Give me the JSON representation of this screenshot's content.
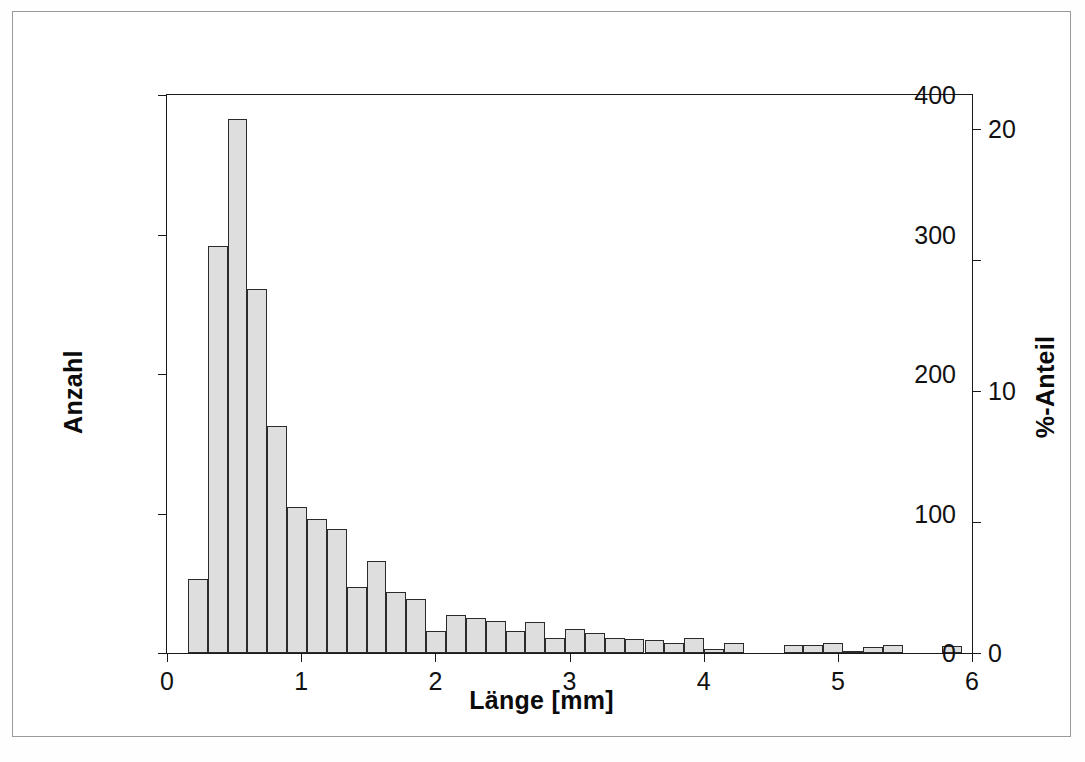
{
  "figure": {
    "background_color": "#ffffff",
    "frame_color": "#9a9a9a",
    "bar_fill_color": "#dedede",
    "bar_edge_color": "#2b2b2b",
    "axis_color": "#1a1a1a"
  },
  "axes": {
    "x_title": "Länge [mm]",
    "y_left_title": "Anzahl",
    "y_right_title": "%-Anteil",
    "x_ticks": [
      {
        "value": 0,
        "label": "0"
      },
      {
        "value": 1,
        "label": "1"
      },
      {
        "value": 2,
        "label": "2"
      },
      {
        "value": 3,
        "label": "3"
      },
      {
        "value": 4,
        "label": "4"
      },
      {
        "value": 5,
        "label": "5"
      },
      {
        "value": 6,
        "label": "6"
      }
    ],
    "y_left_ticks": [
      {
        "value": 0,
        "label": "0"
      },
      {
        "value": 100,
        "label": "100"
      },
      {
        "value": 200,
        "label": "200"
      },
      {
        "value": 300,
        "label": "300"
      },
      {
        "value": 400,
        "label": "400"
      }
    ],
    "y_right_ticks": [
      {
        "value": 0,
        "label": "0"
      },
      {
        "value": 5,
        "label": ""
      },
      {
        "value": 10,
        "label": "10"
      },
      {
        "value": 15,
        "label": ""
      },
      {
        "value": 20,
        "label": "20"
      }
    ]
  },
  "chart_data": {
    "type": "bar",
    "title": "",
    "subtitle": "",
    "xlabel": "Länge [mm]",
    "ylabel": "Anzahl",
    "y2label": "%-Anteil",
    "xlim": [
      0,
      6
    ],
    "ylim": [
      0,
      400
    ],
    "y2lim": [
      0,
      21.3
    ],
    "grid": false,
    "legend": null,
    "bin_width": 0.148,
    "bin_start": 0.155,
    "x_tick_labels": [
      "0",
      "1",
      "2",
      "3",
      "4",
      "5",
      "6"
    ],
    "y_tick_labels": [
      "0",
      "100",
      "200",
      "300",
      "400"
    ],
    "y2_tick_labels": [
      "0",
      "",
      "10",
      "",
      "20"
    ],
    "bins": [
      {
        "x0": 0.155,
        "x1": 0.303,
        "value": 53
      },
      {
        "x0": 0.303,
        "x1": 0.451,
        "value": 292
      },
      {
        "x0": 0.451,
        "x1": 0.599,
        "value": 383
      },
      {
        "x0": 0.599,
        "x1": 0.747,
        "value": 261
      },
      {
        "x0": 0.747,
        "x1": 0.895,
        "value": 163
      },
      {
        "x0": 0.895,
        "x1": 1.043,
        "value": 105
      },
      {
        "x0": 1.043,
        "x1": 1.191,
        "value": 96
      },
      {
        "x0": 1.191,
        "x1": 1.339,
        "value": 89
      },
      {
        "x0": 1.339,
        "x1": 1.487,
        "value": 47
      },
      {
        "x0": 1.487,
        "x1": 1.635,
        "value": 66
      },
      {
        "x0": 1.635,
        "x1": 1.783,
        "value": 44
      },
      {
        "x0": 1.783,
        "x1": 1.931,
        "value": 39
      },
      {
        "x0": 1.931,
        "x1": 2.079,
        "value": 16
      },
      {
        "x0": 2.079,
        "x1": 2.227,
        "value": 27
      },
      {
        "x0": 2.227,
        "x1": 2.375,
        "value": 25
      },
      {
        "x0": 2.375,
        "x1": 2.523,
        "value": 23
      },
      {
        "x0": 2.523,
        "x1": 2.671,
        "value": 16
      },
      {
        "x0": 2.671,
        "x1": 2.819,
        "value": 22
      },
      {
        "x0": 2.819,
        "x1": 2.967,
        "value": 11
      },
      {
        "x0": 2.967,
        "x1": 3.115,
        "value": 17
      },
      {
        "x0": 3.115,
        "x1": 3.263,
        "value": 14
      },
      {
        "x0": 3.263,
        "x1": 3.411,
        "value": 11
      },
      {
        "x0": 3.411,
        "x1": 3.559,
        "value": 10
      },
      {
        "x0": 3.559,
        "x1": 3.707,
        "value": 9
      },
      {
        "x0": 3.707,
        "x1": 3.855,
        "value": 7
      },
      {
        "x0": 3.855,
        "x1": 4.003,
        "value": 11
      },
      {
        "x0": 4.003,
        "x1": 4.151,
        "value": 3
      },
      {
        "x0": 4.151,
        "x1": 4.299,
        "value": 7
      },
      {
        "x0": 4.299,
        "x1": 4.447,
        "value": 0
      },
      {
        "x0": 4.447,
        "x1": 4.595,
        "value": 0
      },
      {
        "x0": 4.595,
        "x1": 4.743,
        "value": 6
      },
      {
        "x0": 4.743,
        "x1": 4.891,
        "value": 6
      },
      {
        "x0": 4.891,
        "x1": 5.039,
        "value": 7
      },
      {
        "x0": 5.039,
        "x1": 5.187,
        "value": 1
      },
      {
        "x0": 5.187,
        "x1": 5.335,
        "value": 4
      },
      {
        "x0": 5.335,
        "x1": 5.483,
        "value": 6
      },
      {
        "x0": 5.483,
        "x1": 5.631,
        "value": 0
      },
      {
        "x0": 5.631,
        "x1": 5.779,
        "value": 0
      },
      {
        "x0": 5.779,
        "x1": 5.927,
        "value": 5
      }
    ]
  }
}
